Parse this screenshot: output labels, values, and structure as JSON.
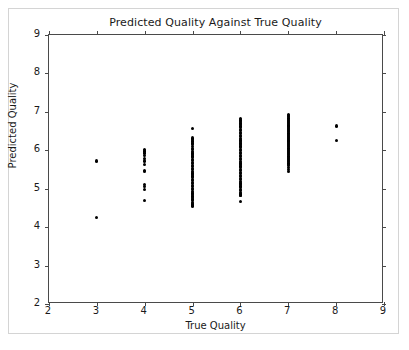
{
  "figure": {
    "width": 409,
    "height": 350,
    "background_color": "#ffffff",
    "border_color": "#d4d4d4"
  },
  "chart_data": {
    "type": "scatter",
    "title": "Predicted Quality Against True Quality",
    "xlabel": "True Quality",
    "ylabel": "Predicted Quality",
    "xlim": [
      2,
      9
    ],
    "ylim": [
      2,
      9
    ],
    "xticks": [
      2,
      3,
      4,
      5,
      6,
      7,
      8,
      9
    ],
    "yticks": [
      2,
      3,
      4,
      5,
      6,
      7,
      8,
      9
    ],
    "xtick_labels": [
      "2",
      "3",
      "4",
      "5",
      "6",
      "7",
      "8",
      "9"
    ],
    "ytick_labels": [
      "2",
      "3",
      "4",
      "5",
      "6",
      "7",
      "8",
      "9"
    ],
    "grid": false,
    "legend": null,
    "marker_color": "#000000",
    "marker_size": 3,
    "series": [
      {
        "name": "predictions",
        "x": [
          3,
          3,
          4,
          4,
          4,
          4,
          4,
          4,
          4,
          4,
          4,
          4,
          4,
          4,
          4,
          5,
          5,
          5,
          5,
          5,
          5,
          5,
          5,
          5,
          5,
          5,
          5,
          5,
          5,
          5,
          5,
          5,
          5,
          5,
          5,
          5,
          5,
          5,
          5,
          5,
          5,
          5,
          5,
          5,
          5,
          5,
          5,
          5,
          5,
          5,
          5,
          5,
          5,
          5,
          5,
          5,
          5,
          5,
          5,
          5,
          5,
          5,
          5,
          6,
          6,
          6,
          6,
          6,
          6,
          6,
          6,
          6,
          6,
          6,
          6,
          6,
          6,
          6,
          6,
          6,
          6,
          6,
          6,
          6,
          6,
          6,
          6,
          6,
          6,
          6,
          6,
          6,
          6,
          6,
          6,
          6,
          6,
          6,
          6,
          6,
          6,
          6,
          6,
          6,
          6,
          6,
          6,
          6,
          6,
          6,
          6,
          6,
          6,
          6,
          6,
          6,
          6,
          6,
          7,
          7,
          7,
          7,
          7,
          7,
          7,
          7,
          7,
          7,
          7,
          7,
          7,
          7,
          7,
          7,
          7,
          7,
          7,
          7,
          7,
          7,
          7,
          7,
          7,
          7,
          7,
          7,
          7,
          7,
          7,
          7,
          7,
          7,
          7,
          7,
          7,
          7,
          7,
          7,
          7,
          7,
          7,
          7,
          7,
          7,
          7,
          7,
          8,
          8
        ],
        "y": [
          5.72,
          4.25,
          6.02,
          5.98,
          5.93,
          5.86,
          5.78,
          5.72,
          5.62,
          5.47,
          5.44,
          5.12,
          5.06,
          4.97,
          4.7,
          6.56,
          6.32,
          6.28,
          6.24,
          6.19,
          6.14,
          6.1,
          6.05,
          6.01,
          5.97,
          5.93,
          5.89,
          5.85,
          5.81,
          5.77,
          5.73,
          5.69,
          5.65,
          5.61,
          5.57,
          5.53,
          5.49,
          5.45,
          5.41,
          5.37,
          5.33,
          5.29,
          5.25,
          5.21,
          5.17,
          5.13,
          5.09,
          5.05,
          5.01,
          4.97,
          4.93,
          4.89,
          4.85,
          4.81,
          4.77,
          4.73,
          4.69,
          4.65,
          4.62,
          4.59,
          4.57,
          4.56,
          4.55,
          6.82,
          6.79,
          6.75,
          6.71,
          6.67,
          6.63,
          6.59,
          6.55,
          6.51,
          6.47,
          6.43,
          6.39,
          6.35,
          6.31,
          6.27,
          6.23,
          6.19,
          6.15,
          6.11,
          6.07,
          6.03,
          5.99,
          5.95,
          5.91,
          5.87,
          5.83,
          5.79,
          5.75,
          5.71,
          5.67,
          5.63,
          5.59,
          5.55,
          5.51,
          5.47,
          5.43,
          5.39,
          5.35,
          5.31,
          5.27,
          5.23,
          5.19,
          5.15,
          5.11,
          5.07,
          5.03,
          4.99,
          4.95,
          4.91,
          4.88,
          4.86,
          4.84,
          4.83,
          4.82,
          4.66,
          6.93,
          6.9,
          6.87,
          6.84,
          6.81,
          6.78,
          6.75,
          6.72,
          6.69,
          6.66,
          6.63,
          6.6,
          6.57,
          6.54,
          6.51,
          6.48,
          6.45,
          6.42,
          6.39,
          6.36,
          6.33,
          6.3,
          6.27,
          6.24,
          6.21,
          6.18,
          6.15,
          6.12,
          6.09,
          6.06,
          6.03,
          6.0,
          5.97,
          5.94,
          5.91,
          5.88,
          5.85,
          5.82,
          5.79,
          5.76,
          5.73,
          5.7,
          5.67,
          5.64,
          5.6,
          5.56,
          5.51,
          5.45,
          6.63,
          6.26
        ]
      }
    ],
    "cluster_summary": [
      {
        "true_quality": 3,
        "count": 2,
        "min": 4.25,
        "max": 5.72
      },
      {
        "true_quality": 4,
        "count": 15,
        "min": 4.7,
        "max": 6.02
      },
      {
        "true_quality": 5,
        "count": 63,
        "min": 4.55,
        "max": 6.56
      },
      {
        "true_quality": 6,
        "count": 55,
        "min": 4.66,
        "max": 6.82
      },
      {
        "true_quality": 7,
        "count": 48,
        "min": 5.45,
        "max": 6.93
      },
      {
        "true_quality": 8,
        "count": 2,
        "min": 6.26,
        "max": 6.63
      }
    ]
  }
}
